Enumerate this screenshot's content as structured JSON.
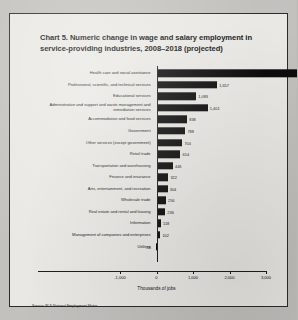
{
  "chart_data": {
    "type": "bar",
    "orientation": "horizontal",
    "title": "Chart 5. Numeric change in wage and salary employment in service-providing industries, 2008–2018 (projected)",
    "xlabel": "Thousands of jobs",
    "ylabel": "",
    "xlim": [
      -1000,
      5000
    ],
    "xticks": [
      -1000,
      0,
      1000,
      2000,
      3000,
      4000,
      5000
    ],
    "xtick_labels": [
      "-1,000",
      "0",
      "1,000",
      "2,000",
      "3,000",
      "4,000",
      "5,000"
    ],
    "grid": false,
    "legend": false,
    "source": "Source: BLS National Employment Matrix",
    "bar_color": "#0c0c0c",
    "categories": [
      "Health care and social assistance",
      "Professional, scientific, and technical services",
      "Educational services",
      "Administrative and support and waste management and remediation services",
      "Accommodation and food services",
      "Government",
      "Other services (except government)",
      "Retail trade",
      "Transportation and warehousing",
      "Finance and insurance",
      "Arts, entertainment, and recreation",
      "Wholesale trade",
      "Real estate and rental and leasing",
      "Information",
      "Management of companies and enterprises",
      "Utilities"
    ],
    "values": [
      4077,
      1657,
      1083,
      1401,
      838,
      788,
      704,
      654,
      446,
      322,
      304,
      256,
      236,
      118,
      102,
      -16
    ],
    "value_labels": [
      "4,077",
      "1,657",
      "1,083",
      "1,401",
      "838",
      "788",
      "704",
      "654",
      "446",
      "322",
      "304",
      "256",
      "236",
      "118",
      "102",
      "-16"
    ]
  }
}
